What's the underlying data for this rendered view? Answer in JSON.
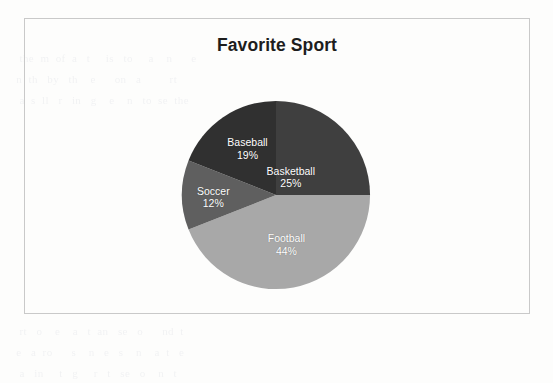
{
  "page": {
    "background_color": "#fdfdfc",
    "ghost_text_lines": [
      "   the  m  of  a   t     is   to     a    n      e",
      "  n  th   by   th    e      on   a         rt   ",
      "   a  s  ll   r   in   g    e    n   to  se  the",
      "",
      "",
      "",
      "",
      "",
      "",
      "",
      "",
      "",
      "",
      "   rt   o    e    a   t  an   se   o      nd  t  ",
      "  e   a  ro      s    n   e   s    n    a  t   e ",
      "   a   in     t   g     r   t   se   o    n   t  "
    ]
  },
  "chart_frame": {
    "border_color": "#c9c9c9"
  },
  "chart_data": {
    "type": "pie",
    "title": "Favorite Sport",
    "categories": [
      "Basketball",
      "Football",
      "Soccer",
      "Baseball"
    ],
    "values": [
      25,
      44,
      12,
      19
    ],
    "value_labels": [
      "25%",
      "44%",
      "12%",
      "19%"
    ],
    "unit": "percent",
    "start_angle_deg": 0,
    "direction": "clockwise",
    "legend": "none",
    "grid": false,
    "slices": [
      {
        "label": "Basketball",
        "value": 25,
        "value_label": "25%",
        "color": "#3f3f3f",
        "label_x_pct": 57.8,
        "label_y_pct": 40.5
      },
      {
        "label": "Football",
        "value": 44,
        "value_label": "44%",
        "color": "#a8a8a8",
        "label_x_pct": 55.5,
        "label_y_pct": 76.0
      },
      {
        "label": "Soccer",
        "value": 12,
        "value_label": "12%",
        "color": "#5f5f5f",
        "label_x_pct": 17.0,
        "label_y_pct": 51.0
      },
      {
        "label": "Baseball",
        "value": 19,
        "value_label": "19%",
        "color": "#303030",
        "label_x_pct": 35.0,
        "label_y_pct": 25.5
      }
    ]
  }
}
